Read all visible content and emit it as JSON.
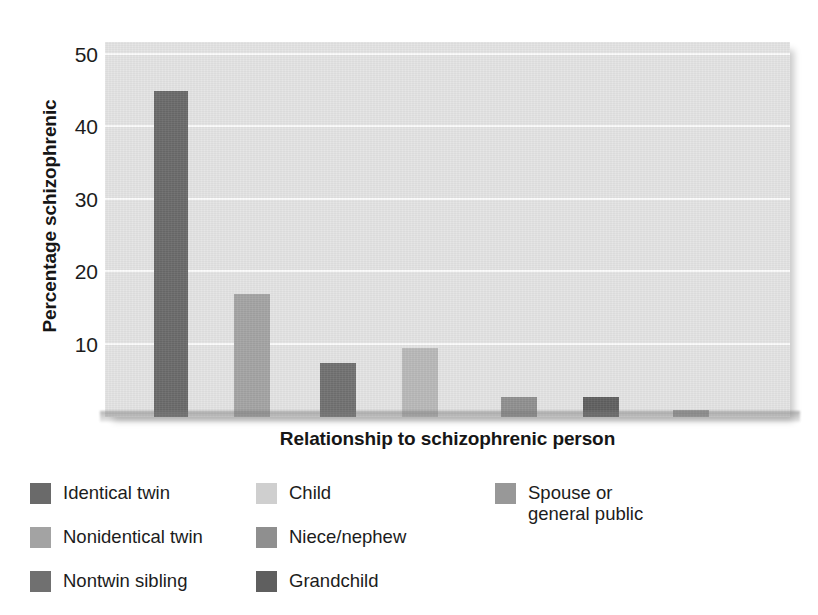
{
  "chart_data": {
    "type": "bar",
    "title": "",
    "xlabel": "Relationship to schizophrenic person",
    "ylabel": "Percentage schizophrenic",
    "categories": [
      "Identical twin",
      "Nonidentical twin",
      "Nontwin sibling",
      "Child",
      "Niece/nephew",
      "Grandchild",
      "Spouse or general public"
    ],
    "values": [
      45,
      17,
      7.5,
      9.5,
      2.7,
      2.7,
      1
    ],
    "bar_colors": [
      "#6a6a6a",
      "#a3a3a3",
      "#707070",
      "#b8b8b8",
      "#8f8f8f",
      "#5f5f5f",
      "#9a9a9a"
    ],
    "ylim": [
      0,
      50
    ],
    "yticks": [
      10,
      20,
      30,
      40,
      50
    ],
    "ytick_labels": [
      "10",
      "20",
      "30",
      "40",
      "50"
    ],
    "xticks": [],
    "grid": true,
    "grid_color": "#fbfbfb",
    "plot_background": "#e3e3e3",
    "legend_position": "below-plot",
    "legend_columns": 3
  },
  "axes": {
    "y_title": "Percentage schizophrenic",
    "x_title": "Relationship to schizophrenic person",
    "y_tick_labels": [
      "50",
      "40",
      "30",
      "20",
      "10"
    ]
  },
  "legend": {
    "columns": [
      {
        "items": [
          {
            "label": "Identical twin",
            "color": "#6a6a6a"
          },
          {
            "label": "Nonidentical twin",
            "color": "#a3a3a3"
          },
          {
            "label": "Nontwin sibling",
            "color": "#707070"
          }
        ]
      },
      {
        "items": [
          {
            "label": "Child",
            "color": "#cfcfcf"
          },
          {
            "label": "Niece/nephew",
            "color": "#8f8f8f"
          },
          {
            "label": "Grandchild",
            "color": "#5f5f5f"
          }
        ]
      },
      {
        "items": [
          {
            "label": "Spouse or\ngeneral public",
            "color": "#989898"
          }
        ]
      }
    ]
  }
}
